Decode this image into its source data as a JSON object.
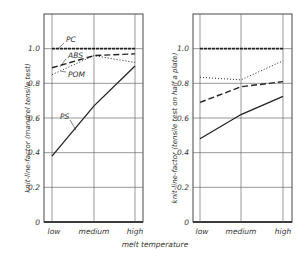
{
  "chart_data": [
    {
      "type": "line",
      "title": "",
      "xlabel": "melt temperature",
      "ylabel": "knit-line-factor (mandrel tensile test)",
      "categories": [
        "low",
        "medium",
        "high"
      ],
      "yticks": [
        "0",
        "0.2",
        "0.4",
        "0.6",
        "0.8",
        "1.0"
      ],
      "ylim": [
        0,
        1.2
      ],
      "grid": true,
      "series": [
        {
          "name": "PC",
          "style": "dash-dot-fine",
          "values": [
            1.0,
            1.0,
            1.0
          ]
        },
        {
          "name": "ABS",
          "style": "dashed",
          "values": [
            0.89,
            0.96,
            0.97
          ]
        },
        {
          "name": "POM",
          "style": "dotted",
          "values": [
            0.85,
            0.96,
            0.92
          ]
        },
        {
          "name": "PS",
          "style": "solid",
          "values": [
            0.38,
            0.67,
            0.9
          ]
        }
      ]
    },
    {
      "type": "line",
      "title": "",
      "xlabel": "",
      "ylabel": "knit-line-factor (tensile test on half a plate)",
      "categories": [
        "low",
        "medium",
        "high"
      ],
      "yticks": [
        "0",
        "0.2",
        "0.4",
        "0.6",
        "0.8",
        "1.0"
      ],
      "ylim": [
        0,
        1.2
      ],
      "grid": true,
      "series": [
        {
          "name": "PC",
          "style": "dash-dot-fine",
          "values": [
            1.0,
            1.0,
            1.0
          ]
        },
        {
          "name": "ABS",
          "style": "dashed",
          "values": [
            0.69,
            0.78,
            0.81
          ]
        },
        {
          "name": "POM",
          "style": "dotted",
          "values": [
            0.835,
            0.82,
            0.93
          ]
        },
        {
          "name": "PS",
          "style": "solid",
          "values": [
            0.48,
            0.62,
            0.725
          ]
        }
      ]
    }
  ],
  "shared_xlabel": "melt temperature"
}
